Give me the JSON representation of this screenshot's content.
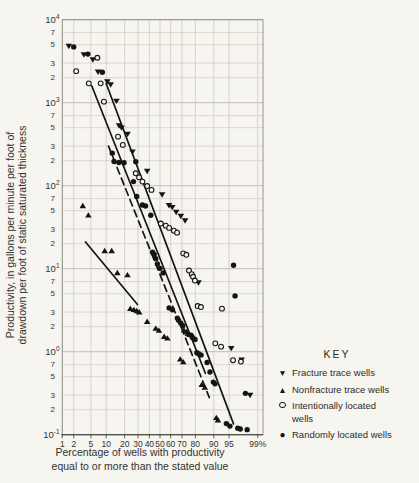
{
  "figure": {
    "colors": {
      "background": "#f7f5f0",
      "grid": "#c7c4bb",
      "grid_major": "#b3b0a7",
      "frame": "#8f8c83",
      "axis": "#3a3834",
      "ink": "#161514",
      "text": "#34322e"
    }
  },
  "chart_data": {
    "type": "scatter",
    "title": "",
    "xlabel_lines": [
      "Percentage of wells with productivity",
      "equal to or more than the stated value"
    ],
    "ylabel_lines": [
      "Productivity, in gallons per minute per foot of",
      "drawdown per foot of static saturated thickness"
    ],
    "x_scale": "normal-probability-percent",
    "y_scale": "log",
    "x_range_percent": [
      1,
      99
    ],
    "y_range": [
      0.1,
      10000
    ],
    "grid": "on",
    "x_ticks": [
      {
        "value": 1,
        "label": "1"
      },
      {
        "value": 2,
        "label": "2"
      },
      {
        "value": 5,
        "label": "5"
      },
      {
        "value": 10,
        "label": "10"
      },
      {
        "value": 20,
        "label": "20"
      },
      {
        "value": 30,
        "label": "30"
      },
      {
        "value": 40,
        "label": "40"
      },
      {
        "value": 50,
        "label": "50"
      },
      {
        "value": 60,
        "label": "60"
      },
      {
        "value": 70,
        "label": "70"
      },
      {
        "value": 80,
        "label": "80"
      },
      {
        "value": 90,
        "label": "90"
      },
      {
        "value": 95,
        "label": "95"
      },
      {
        "value": 99,
        "label": "99%"
      }
    ],
    "y_decade_exponents": [
      4,
      3,
      2,
      1,
      0,
      -1
    ],
    "y_minor_multipliers": [
      7,
      5,
      3,
      2
    ],
    "key": {
      "title": "KEY",
      "entries": [
        {
          "marker": "triangle-down-filled",
          "glyph": "▼",
          "label_lines": [
            "Fracture trace wells"
          ]
        },
        {
          "marker": "triangle-up-filled",
          "glyph": "▲",
          "label_lines": [
            "Nonfracture trace wells"
          ]
        },
        {
          "marker": "circle-open",
          "glyph": "○",
          "label_lines": [
            "Intentionally located",
            "wells"
          ]
        },
        {
          "marker": "circle-filled",
          "glyph": "●",
          "label_lines": [
            "Randomly located wells"
          ]
        }
      ]
    },
    "series": [
      {
        "name": "fracture-trace-wells",
        "marker": "triangle-down-filled",
        "points": [
          [
            1.5,
            4800
          ],
          [
            3.5,
            3800
          ],
          [
            5.5,
            3300
          ],
          [
            7,
            2350
          ],
          [
            10.5,
            1800
          ],
          [
            12,
            1650
          ],
          [
            15,
            1050
          ],
          [
            16.5,
            530
          ],
          [
            18,
            500
          ],
          [
            22,
            420
          ],
          [
            25.6,
            257
          ],
          [
            38,
            150
          ],
          [
            52,
            78
          ],
          [
            58.5,
            58
          ],
          [
            61.5,
            55
          ],
          [
            65,
            48
          ],
          [
            69,
            43
          ],
          [
            72.5,
            38
          ],
          [
            82,
            6.8
          ],
          [
            95.5,
            1.1
          ],
          [
            97.4,
            0.8
          ],
          [
            98.4,
            0.3
          ]
        ]
      },
      {
        "name": "nonfracture-trace-wells",
        "marker": "triangle-up-filled",
        "points": [
          [
            3.3,
            57
          ],
          [
            4.4,
            44
          ],
          [
            9.4,
            16.4
          ],
          [
            12.5,
            16.4
          ],
          [
            15.5,
            8.9
          ],
          [
            21.9,
            8.4
          ],
          [
            24,
            3.3
          ],
          [
            26.7,
            3.2
          ],
          [
            29,
            3.1
          ],
          [
            31,
            3.0
          ],
          [
            38,
            2.3
          ],
          [
            46,
            1.9
          ],
          [
            49,
            1.8
          ],
          [
            54,
            1.52
          ],
          [
            57,
            1.45
          ],
          [
            68.5,
            0.81
          ],
          [
            71,
            0.75
          ],
          [
            71.6,
            1.81
          ],
          [
            73.7,
            1.73
          ],
          [
            74.7,
            1.65
          ],
          [
            76,
            1.6
          ],
          [
            84,
            0.4
          ],
          [
            85.7,
            0.37
          ],
          [
            91,
            0.16
          ],
          [
            91.6,
            0.15
          ]
        ]
      },
      {
        "name": "intentionally-located-wells",
        "marker": "circle-open",
        "points": [
          [
            2.3,
            2400
          ],
          [
            4.5,
            1710
          ],
          [
            6.8,
            3480
          ],
          [
            7.9,
            1710
          ],
          [
            9.1,
            1030
          ],
          [
            15.9,
            390
          ],
          [
            18.8,
            310
          ],
          [
            28.2,
            141
          ],
          [
            30.9,
            126
          ],
          [
            33.8,
            112
          ],
          [
            38,
            99
          ],
          [
            42,
            89
          ],
          [
            50.8,
            35
          ],
          [
            55.5,
            33
          ],
          [
            58.6,
            31
          ],
          [
            63,
            28.7
          ],
          [
            65.8,
            27.2
          ],
          [
            71,
            15.3
          ],
          [
            73.5,
            14.7
          ],
          [
            75.5,
            9.5
          ],
          [
            77.5,
            8.6
          ],
          [
            78.4,
            8.0
          ],
          [
            79.7,
            7.2
          ],
          [
            81.5,
            3.55
          ],
          [
            83.5,
            3.45
          ],
          [
            93,
            3.3
          ],
          [
            90.6,
            1.26
          ],
          [
            92.7,
            1.15
          ],
          [
            95.9,
            0.79
          ],
          [
            97.3,
            0.76
          ]
        ]
      },
      {
        "name": "randomly-located-wells",
        "marker": "circle-filled",
        "points": [
          [
            2,
            4700
          ],
          [
            4.3,
            3850
          ],
          [
            8.5,
            2330
          ],
          [
            12.8,
            246
          ],
          [
            13.7,
            196
          ],
          [
            16.4,
            190
          ],
          [
            19.6,
            189
          ],
          [
            28.2,
            195
          ],
          [
            26.4,
            112
          ],
          [
            29,
            74
          ],
          [
            33.8,
            58.5
          ],
          [
            36.5,
            57
          ],
          [
            41.3,
            44
          ],
          [
            43,
            15.8
          ],
          [
            44.5,
            14.9
          ],
          [
            46,
            13.2
          ],
          [
            47.5,
            11.4
          ],
          [
            50,
            10.1
          ],
          [
            53,
            8.9
          ],
          [
            58.6,
            3.37
          ],
          [
            61.6,
            3.2
          ],
          [
            66,
            2.54
          ],
          [
            67,
            2.4
          ],
          [
            69,
            2.2
          ],
          [
            70.6,
            2.05
          ],
          [
            77,
            1.58
          ],
          [
            78,
            1.48
          ],
          [
            79.8,
            1.4
          ],
          [
            81,
            0.97
          ],
          [
            82.3,
            0.94
          ],
          [
            83.6,
            0.91
          ],
          [
            86.9,
            0.74
          ],
          [
            88.3,
            0.57
          ],
          [
            89.8,
            0.43
          ],
          [
            90.5,
            0.41
          ],
          [
            96,
            11
          ],
          [
            96.3,
            4.7
          ],
          [
            94.3,
            0.136
          ],
          [
            95.2,
            0.127
          ],
          [
            96.8,
            0.12
          ],
          [
            97.2,
            0.117
          ],
          [
            98.1,
            0.115
          ],
          [
            97.9,
            0.315
          ]
        ]
      }
    ],
    "trend_lines": [
      {
        "name": "intentionally-located-trend",
        "style": "solid",
        "from": [
          5.2,
          1600
        ],
        "to": [
          86,
          0.55
        ]
      },
      {
        "name": "fracture-trace-trend",
        "style": "solid",
        "from": [
          10,
          1700
        ],
        "to": [
          96,
          0.135
        ]
      },
      {
        "name": "randomly-located-trend",
        "style": "dashed",
        "from": [
          11,
          300
        ],
        "to": [
          88,
          0.28
        ]
      },
      {
        "name": "nonfracture-trace-trend",
        "style": "solid",
        "from": [
          3.8,
          21
        ],
        "to": [
          29.6,
          3.7
        ]
      }
    ]
  }
}
